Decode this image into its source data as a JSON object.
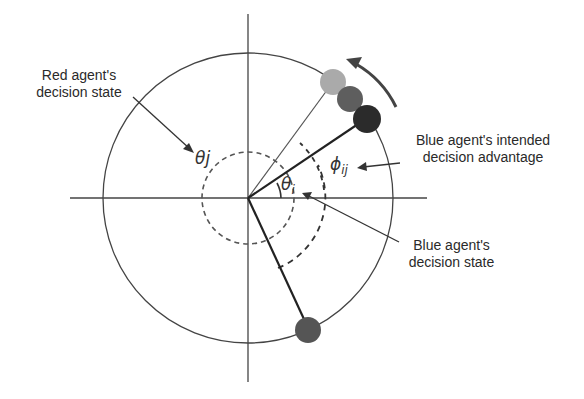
{
  "diagram": {
    "labels": {
      "red_state": [
        "Red agent's",
        "decision state"
      ],
      "blue_advantage": [
        "Blue agent's intended",
        "decision advantage"
      ],
      "blue_state": [
        "Blue agent's",
        "decision state"
      ]
    },
    "symbols": {
      "theta_j": "θj",
      "theta_i_base": "θ",
      "theta_i_sub": "i",
      "phi_base": "ϕ",
      "phi_sub": "ij"
    },
    "agents": [
      {
        "name": "blue-current",
        "color": "#2b2b2b"
      },
      {
        "name": "blue-mid",
        "color": "#5c5c5c"
      },
      {
        "name": "blue-intended",
        "color": "#a8a8a8"
      },
      {
        "name": "red",
        "color": "#555555"
      }
    ]
  }
}
